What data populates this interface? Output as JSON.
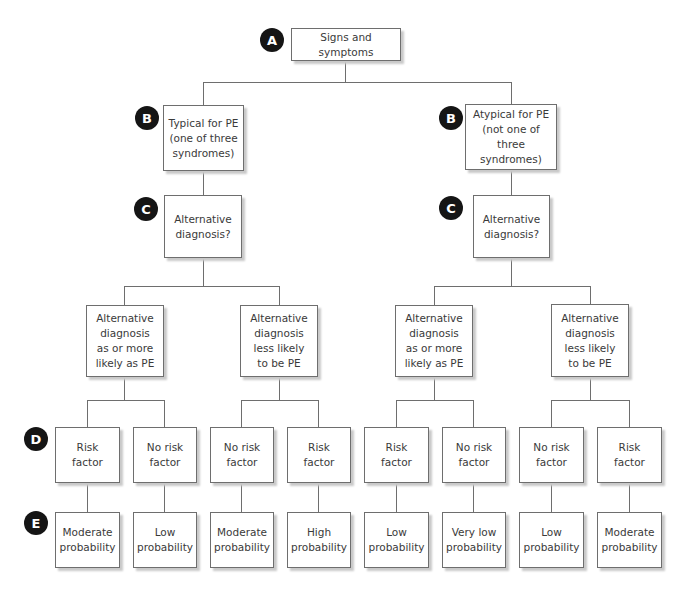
{
  "badges": {
    "A": "A",
    "B": "B",
    "C": "C",
    "D": "D",
    "E": "E"
  },
  "root": {
    "label": "Signs and symptoms"
  },
  "level_b": {
    "left": "Typical for PE\n(one of three\nsyndromes)",
    "right": "Atypical for PE\n(not one of three\nsyndromes)"
  },
  "level_c": {
    "left": "Alternative\ndiagnosis?",
    "right": "Alternative\ndiagnosis?"
  },
  "level_alt": [
    "Alternative\ndiagnosis\nas or more\nlikely as PE",
    "Alternative\ndiagnosis\nless likely\nto be PE",
    "Alternative\ndiagnosis\nas or more\nlikely as PE",
    "Alternative\ndiagnosis\nless likely\nto be PE"
  ],
  "level_d": [
    "Risk\nfactor",
    "No risk\nfactor",
    "No risk\nfactor",
    "Risk\nfactor",
    "Risk\nfactor",
    "No risk\nfactor",
    "No risk\nfactor",
    "Risk\nfactor"
  ],
  "level_e": [
    "Moderate\nprobability",
    "Low\nprobability",
    "Moderate\nprobability",
    "High\nprobability",
    "Low\nprobability",
    "Very low\nprobability",
    "Low\nprobability",
    "Moderate\nprobability"
  ]
}
